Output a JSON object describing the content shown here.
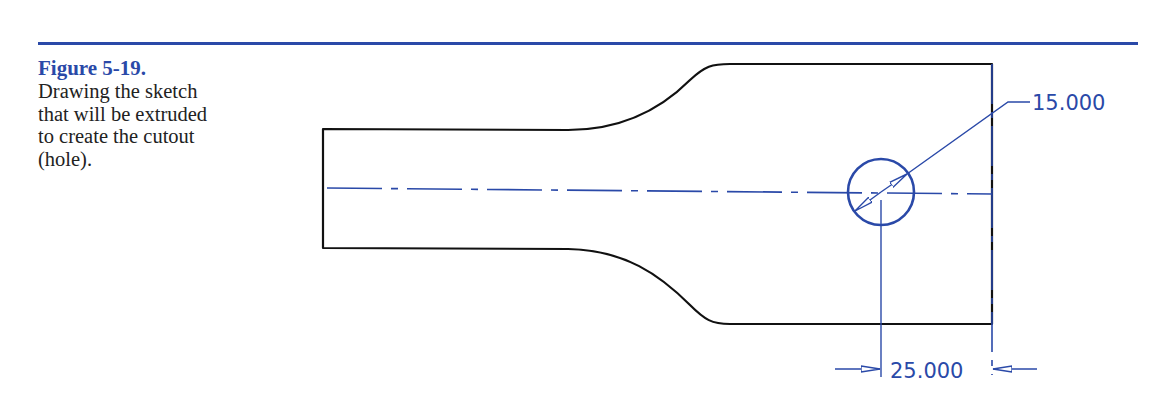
{
  "figure": {
    "title": "Figure 5-19.",
    "caption": "Drawing the sketch that will be extruded to create the cutout (hole).",
    "caption_lines": [
      "Drawing the sketch",
      "that will be extruded",
      "to create the cutout",
      "(hole)."
    ]
  },
  "drawing": {
    "dimensions": {
      "diameter": "15.000",
      "horizontal": "25.000"
    },
    "colors": {
      "outline": "#111111",
      "annotation": "#2a49a8"
    }
  }
}
